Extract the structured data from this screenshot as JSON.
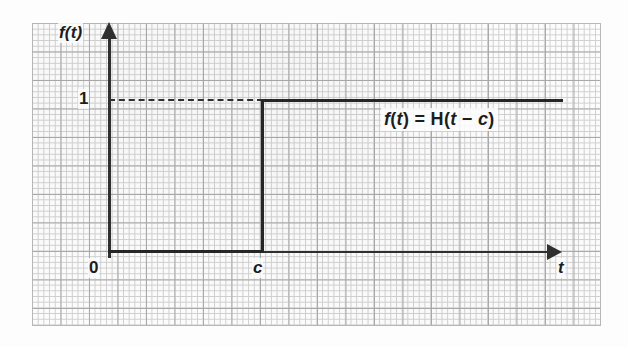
{
  "figure": {
    "background_color": "#fdfdfd",
    "ink_color": "#262626",
    "grid_major_color": "#a8a8a8",
    "grid_minor_color": "#cfcfcf"
  },
  "axes": {
    "y_axis_label": "f(t)",
    "x_axis_label": "t",
    "origin_label": "0",
    "y_tick_label": "1",
    "x_tick_label": "c"
  },
  "annotation": {
    "equation_full": "f(t) = H(t − c)",
    "parts": {
      "f": "f",
      "open1": "(",
      "t1": "t",
      "close1": ")",
      "equals": " = ",
      "H": "H",
      "open2": "(",
      "t2": "t",
      "minus": " − ",
      "c": "c",
      "close2": ")"
    }
  },
  "chart_data": {
    "type": "line",
    "title": "",
    "subtitle": "",
    "xlabel": "t",
    "ylabel": "f(t)",
    "xlim": [
      0,
      1
    ],
    "ylim": [
      0,
      1.35
    ],
    "grid": true,
    "legend_position": "none",
    "series": [
      {
        "name": "f(t) = H(t − c)",
        "style": "solid",
        "x": [
          0,
          "c",
          "c",
          "t_max"
        ],
        "y": [
          0,
          0,
          1,
          1
        ],
        "description": "Unit step: value 0 for t < c, value 1 for t > c, jump discontinuity at t = c"
      },
      {
        "name": "guide line at y = 1",
        "style": "dashed",
        "x": [
          0,
          "c"
        ],
        "y": [
          1,
          1
        ],
        "description": "Dashed horizontal guide from the f(t) axis at height 1 to the jump at t = c"
      }
    ],
    "x_ticks": [
      {
        "value": 0,
        "label": "0"
      },
      {
        "value": "c",
        "label": "c"
      }
    ],
    "y_ticks": [
      {
        "value": 1,
        "label": "1"
      }
    ],
    "annotations": [
      {
        "text": "f(t) = H(t − c)",
        "position": "right of jump, just below the y = 1 line"
      }
    ]
  }
}
